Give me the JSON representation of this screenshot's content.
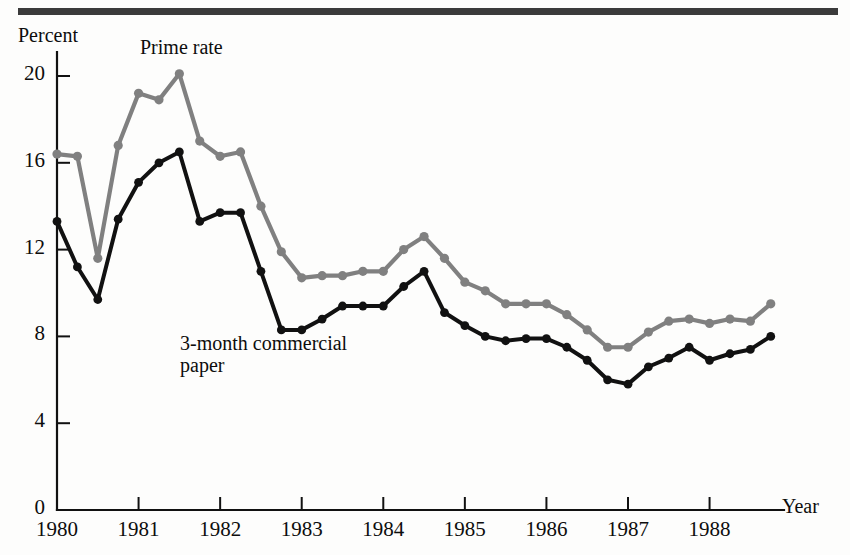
{
  "figure": {
    "axis_title_y": "Percent",
    "axis_title_x": "Year",
    "series_label_prime": "Prime rate",
    "series_label_paper_line1": "3-month commercial",
    "series_label_paper_line2": "paper",
    "color_prime": "#808080",
    "color_paper": "#111111",
    "color_axis": "#111111",
    "color_rule": "#3b3b3b"
  },
  "chart_data": {
    "type": "line",
    "title": "",
    "subtitle": "",
    "xlabel": "Year",
    "ylabel": "Percent",
    "xlim": [
      1980.0,
      1988.75
    ],
    "ylim": [
      0,
      21.5
    ],
    "yticks": [
      0,
      4,
      8,
      12,
      16,
      20
    ],
    "ytick_labels": [
      "0",
      "4",
      "8",
      "12",
      "16",
      "20"
    ],
    "xticks": [
      1980,
      1981,
      1982,
      1983,
      1984,
      1985,
      1986,
      1987,
      1988
    ],
    "xtick_labels": [
      "1980",
      "1981",
      "1982",
      "1983",
      "1984",
      "1985",
      "1986",
      "1987",
      "1988"
    ],
    "grid": false,
    "legend": "inline-annotations",
    "x": [
      1980.0,
      1980.25,
      1980.5,
      1980.75,
      1981.0,
      1981.25,
      1981.5,
      1981.75,
      1982.0,
      1982.25,
      1982.5,
      1982.75,
      1983.0,
      1983.25,
      1983.5,
      1983.75,
      1984.0,
      1984.25,
      1984.5,
      1984.75,
      1985.0,
      1985.25,
      1985.5,
      1985.75,
      1986.0,
      1986.25,
      1986.5,
      1986.75,
      1987.0,
      1987.25,
      1987.5,
      1987.75,
      1988.0,
      1988.25,
      1988.5,
      1988.75
    ],
    "series": [
      {
        "name": "Prime rate",
        "color": "#808080",
        "marker": "circle",
        "values": [
          16.4,
          16.3,
          11.6,
          16.8,
          19.2,
          18.9,
          20.1,
          17.0,
          16.3,
          16.5,
          14.0,
          11.9,
          10.7,
          10.8,
          10.8,
          11.0,
          11.0,
          12.0,
          12.6,
          11.6,
          10.5,
          10.1,
          9.5,
          9.5,
          9.5,
          9.0,
          8.3,
          7.5,
          7.5,
          8.2,
          8.7,
          8.8,
          8.6,
          8.8,
          8.7,
          9.5
        ]
      },
      {
        "name": "3-month commercial paper",
        "color": "#111111",
        "marker": "circle",
        "values": [
          13.3,
          11.2,
          9.7,
          13.4,
          15.1,
          16.0,
          16.5,
          13.3,
          13.7,
          13.7,
          11.0,
          8.3,
          8.3,
          8.8,
          9.4,
          9.4,
          9.4,
          10.3,
          11.0,
          9.1,
          8.5,
          8.0,
          7.8,
          7.9,
          7.9,
          7.5,
          6.9,
          6.0,
          5.8,
          6.6,
          7.0,
          7.5,
          6.9,
          7.2,
          7.4,
          8.0
        ]
      }
    ]
  }
}
